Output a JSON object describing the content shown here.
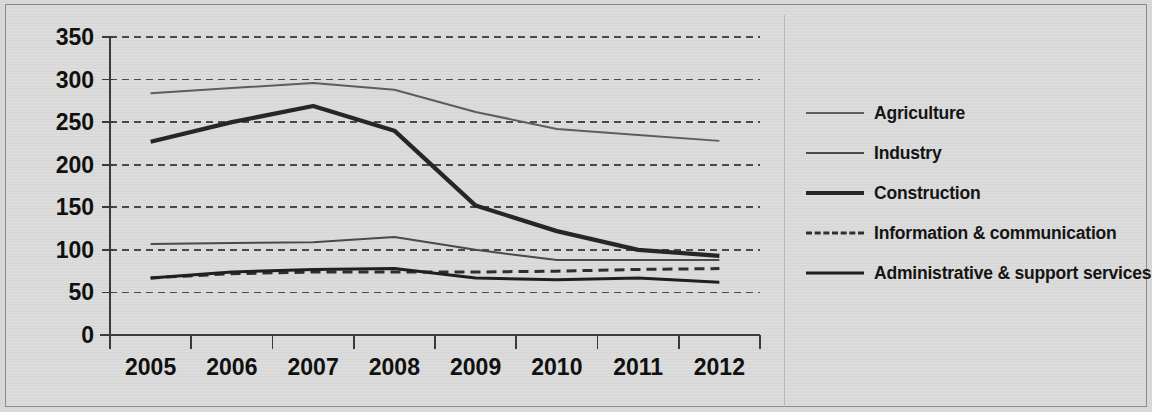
{
  "chart_data": {
    "type": "line",
    "title": "",
    "xlabel": "",
    "ylabel": "",
    "categories": [
      "2005",
      "2006",
      "2007",
      "2008",
      "2009",
      "2010",
      "2011",
      "2012"
    ],
    "ylim": [
      0,
      350
    ],
    "yticks": [
      0,
      50,
      100,
      150,
      200,
      250,
      300,
      350
    ],
    "ytick_labels": [
      "0",
      "50",
      "100",
      "150",
      "200",
      "250",
      "300",
      "350"
    ],
    "grid": true,
    "grid_style": "dashed-horizontal",
    "legend_position": "right",
    "series": [
      {
        "name": "Agriculture",
        "style": "solid-thin",
        "color": "#5d5d5d",
        "values": [
          284,
          290,
          296,
          288,
          262,
          242,
          235,
          228
        ]
      },
      {
        "name": "Industry",
        "style": "solid-thin",
        "color": "#4a4a4a",
        "values": [
          107,
          108,
          109,
          115,
          100,
          88,
          88,
          88
        ]
      },
      {
        "name": "Construction",
        "style": "solid-thick",
        "color": "#262626",
        "values": [
          227,
          250,
          269,
          240,
          152,
          122,
          100,
          93
        ]
      },
      {
        "name": "Information & communication",
        "style": "dashed",
        "color": "#2e2e2e",
        "values": [
          67,
          72,
          74,
          74,
          74,
          75,
          77,
          78
        ]
      },
      {
        "name": "Administrative & support services",
        "style": "solid-heavy",
        "color": "#1f1f1f",
        "values": [
          67,
          74,
          77,
          78,
          67,
          65,
          67,
          62
        ]
      }
    ]
  },
  "legend": {
    "items": [
      {
        "label": "Agriculture",
        "key": "line-key-agriculture"
      },
      {
        "label": "Industry",
        "key": "line-key-industry"
      },
      {
        "label": "Construction",
        "key": "line-key-construction"
      },
      {
        "label": "Information & communication",
        "key": "line-key-information-communication"
      },
      {
        "label": "Administrative & support services",
        "key": "line-key-administrative-support-services"
      }
    ]
  },
  "axes": {
    "y_labels": [
      "350",
      "300",
      "250",
      "200",
      "150",
      "100",
      "50",
      "0"
    ],
    "x_labels": [
      "2005",
      "2006",
      "2007",
      "2008",
      "2009",
      "2010",
      "2011",
      "2012"
    ]
  },
  "colors": {
    "background": "#d9d9d9",
    "frame": "#8a8a8a",
    "axis": "#3a3a3a",
    "grid": "#4a4a4a",
    "text": "#101010"
  }
}
